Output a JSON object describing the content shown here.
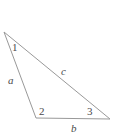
{
  "figure": {
    "name": "triangle-diagram",
    "type": "geometry-diagram",
    "shape": "scalene-triangle",
    "background_color": "#ffffff",
    "stroke_color": "#999999",
    "label_color": "#4a4a4a",
    "stroke_width": 1,
    "vertices": [
      {
        "id": "apex",
        "x": 4,
        "y": 32
      },
      {
        "id": "bottom-left",
        "x": 36,
        "y": 118
      },
      {
        "id": "bottom-right",
        "x": 110,
        "y": 119
      }
    ],
    "angle_labels": [
      {
        "id": "angle-1",
        "text": "1",
        "style": "upright",
        "x": 12,
        "y": 42,
        "at_vertex": "apex"
      },
      {
        "id": "angle-2",
        "text": "2",
        "style": "upright",
        "x": 39,
        "y": 106,
        "at_vertex": "bottom-left"
      },
      {
        "id": "angle-3",
        "text": "3",
        "style": "upright",
        "x": 87,
        "y": 106,
        "at_vertex": "bottom-right"
      }
    ],
    "side_labels": [
      {
        "id": "side-a",
        "text": "a",
        "style": "italic",
        "x": 8,
        "y": 75,
        "between": [
          "apex",
          "bottom-left"
        ]
      },
      {
        "id": "side-c",
        "text": "c",
        "style": "italic",
        "x": 61,
        "y": 66,
        "between": [
          "apex",
          "bottom-right"
        ]
      },
      {
        "id": "side-b",
        "text": "b",
        "style": "italic",
        "x": 71,
        "y": 123,
        "between": [
          "bottom-left",
          "bottom-right"
        ]
      }
    ],
    "polygon_points": "4,32 36,118 110,119"
  }
}
